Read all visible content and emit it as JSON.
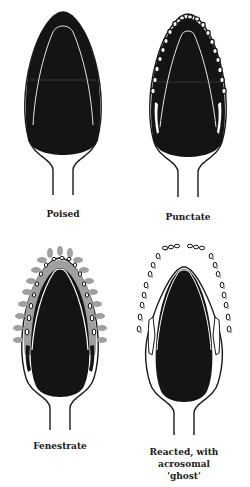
{
  "figure": {
    "type": "acrosome reaction stages diagram",
    "colors": {
      "nucleus": "#141414",
      "outline": "#1a1a1a",
      "vesicle_fill": "#ffffff",
      "vesicle_halo": "#9a9a9a",
      "background": "#ffffff"
    },
    "panels": [
      {
        "id": "poised",
        "label": "Poised"
      },
      {
        "id": "punctate",
        "label": "Punctate"
      },
      {
        "id": "fenestrate",
        "label": "Fenestrate"
      },
      {
        "id": "reacted",
        "label": "Reacted, with\nacrosomal\n'ghost'"
      }
    ]
  }
}
